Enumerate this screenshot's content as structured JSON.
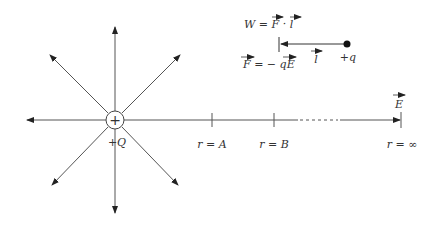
{
  "diagram": {
    "charge": {
      "label": "+Q",
      "symbol": "+"
    },
    "work_equation": {
      "lhs": "W",
      "eq": "=",
      "F": "F",
      "dot": "·",
      "l": "l"
    },
    "force_equation": {
      "F": "F",
      "eq": "=",
      "minus": "−",
      "q": "q",
      "E": "E"
    },
    "displacement_label": "l",
    "test_charge_label": "+q",
    "field_label": "E",
    "positions": [
      {
        "label_r": "r",
        "eq": "=",
        "label_val": "A"
      },
      {
        "label_r": "r",
        "eq": "=",
        "label_val": "B"
      },
      {
        "label_r": "r",
        "eq": "=",
        "label_val": "∞"
      }
    ],
    "colors": {
      "line": "#444444",
      "arrow": "#222222",
      "text": "#333333"
    }
  }
}
